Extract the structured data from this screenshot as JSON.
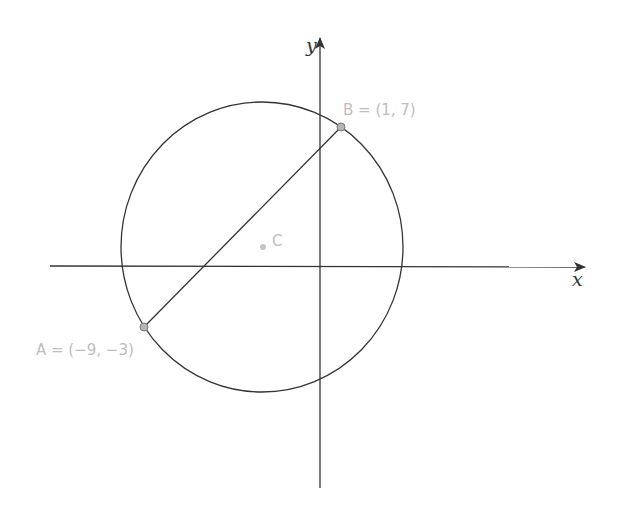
{
  "diagram": {
    "type": "coordinate-geometry",
    "axes": {
      "x_label": "x",
      "y_label": "y"
    },
    "points": {
      "A": {
        "name": "A",
        "coords": [
          -9,
          -3
        ],
        "label": "A = (−9, −3)"
      },
      "B": {
        "name": "B",
        "coords": [
          1,
          7
        ],
        "label": "B = (1, 7)"
      },
      "C": {
        "name": "C",
        "label": "C"
      }
    },
    "segments": [
      {
        "from": "A",
        "to": "B",
        "role": "diameter"
      }
    ],
    "circle": {
      "center": "C",
      "through": [
        "A",
        "B"
      ]
    },
    "colors": {
      "line": "#333333",
      "point_fill": "#b5b5b5",
      "point_stroke": "#7a7a7a",
      "label": "#bdbdbd"
    }
  }
}
